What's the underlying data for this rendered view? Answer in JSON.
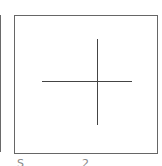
{
  "panels": {
    "left": {
      "label": "",
      "clipped": true
    },
    "main": {
      "label": "",
      "content": "crosshair",
      "border_color": "#666666",
      "line_color": "#444444"
    }
  },
  "icons": {
    "crosshair": "plus-crosshair"
  },
  "captions": {
    "left_fragment": "S",
    "right_fragment": "2"
  }
}
